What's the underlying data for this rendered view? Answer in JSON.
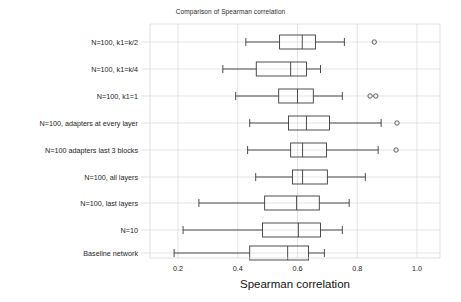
{
  "chart_data": {
    "type": "boxplot",
    "title": "Comparison of Spearman correlation",
    "xlabel": "Spearman correlation",
    "ylabel": "",
    "orientation": "horizontal",
    "xlim": [
      0.12,
      1.07
    ],
    "grid": true,
    "legend": null,
    "xticks": [
      0.2,
      0.4,
      0.6,
      0.8,
      1.0
    ],
    "xtick_labels": [
      "0.2",
      "0.4",
      "0.6",
      "0.8",
      "1.0"
    ],
    "categories": [
      "N=100,  k1=k/2",
      "N=100, k1=k/4",
      "N=100, k1=1",
      "N=100, adapters at every layer",
      "N=100 adapters last 3 blocks",
      "N=100, all layers",
      "N=100, last layers",
      "N=10",
      "Baseline network"
    ],
    "boxes": [
      {
        "label": "N=100,  k1=k/2",
        "whisker_low": 0.427,
        "q1": 0.54,
        "median": 0.616,
        "q3": 0.66,
        "whisker_high": 0.757,
        "outliers": [
          0.857
        ]
      },
      {
        "label": "N=100, k1=k/4",
        "whisker_low": 0.35,
        "q1": 0.462,
        "median": 0.577,
        "q3": 0.63,
        "whisker_high": 0.677,
        "outliers": []
      },
      {
        "label": "N=100, k1=1",
        "whisker_low": 0.393,
        "q1": 0.537,
        "median": 0.6,
        "q3": 0.653,
        "whisker_high": 0.75,
        "outliers": [
          0.843,
          0.862
        ]
      },
      {
        "label": "N=100, adapters at every layer",
        "whisker_low": 0.44,
        "q1": 0.57,
        "median": 0.63,
        "q3": 0.707,
        "whisker_high": 0.88,
        "outliers": [
          0.933
        ]
      },
      {
        "label": "N=100 adapters last 3 blocks",
        "whisker_low": 0.433,
        "q1": 0.577,
        "median": 0.617,
        "q3": 0.697,
        "whisker_high": 0.87,
        "outliers": [
          0.93
        ]
      },
      {
        "label": "N=100, all layers",
        "whisker_low": 0.46,
        "q1": 0.583,
        "median": 0.617,
        "q3": 0.7,
        "whisker_high": 0.827,
        "outliers": []
      },
      {
        "label": "N=100, last layers",
        "whisker_low": 0.27,
        "q1": 0.49,
        "median": 0.597,
        "q3": 0.673,
        "whisker_high": 0.773,
        "outliers": []
      },
      {
        "label": "N=10",
        "whisker_low": 0.217,
        "q1": 0.483,
        "median": 0.603,
        "q3": 0.677,
        "whisker_high": 0.75,
        "outliers": []
      },
      {
        "label": "Baseline network",
        "whisker_low": 0.187,
        "q1": 0.44,
        "median": 0.567,
        "q3": 0.637,
        "whisker_high": 0.69,
        "outliers": []
      }
    ],
    "colors": {
      "box_edge": "#3a3a3a",
      "median": "#3a3a3a",
      "whisker": "#3a3a3a",
      "grid": "#d8d8d8",
      "axis": "#6a6a6a",
      "background": "#ffffff"
    }
  },
  "title": "Comparison of Spearman correlation",
  "axis": {
    "x_label": "Spearman correlation"
  }
}
